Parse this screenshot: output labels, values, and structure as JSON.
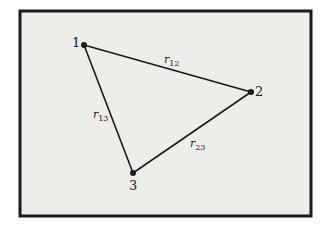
{
  "diagram": {
    "type": "triangle-distance-diagram",
    "colors": {
      "background": "#ffffff",
      "panel": "#ededea",
      "frame": "#1a1a1a",
      "line": "#1a1a1a"
    },
    "vertices": [
      {
        "id": "1",
        "label": "1",
        "x": 84,
        "y": 45
      },
      {
        "id": "2",
        "label": "2",
        "x": 251,
        "y": 92
      },
      {
        "id": "3",
        "label": "3",
        "x": 133,
        "y": 173
      }
    ],
    "edges": [
      {
        "from": "1",
        "to": "2",
        "symbol": "r",
        "subscript": "12"
      },
      {
        "from": "1",
        "to": "3",
        "symbol": "r",
        "subscript": "13"
      },
      {
        "from": "2",
        "to": "3",
        "symbol": "r",
        "subscript": "23"
      }
    ]
  }
}
